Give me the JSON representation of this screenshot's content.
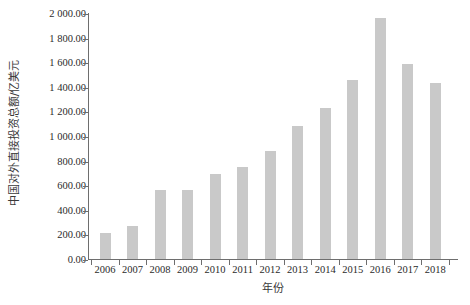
{
  "chart_data": {
    "type": "bar",
    "title": "",
    "subtitle": "",
    "xlabel": "年份",
    "ylabel": "中国对外直接投资总额/亿美元",
    "categories": [
      "2006",
      "2007",
      "2008",
      "2009",
      "2010",
      "2011",
      "2012",
      "2013",
      "2014",
      "2015",
      "2016",
      "2017",
      "2018"
    ],
    "values": [
      211,
      265,
      559,
      565,
      688,
      747,
      878,
      1078,
      1231,
      1456,
      1961,
      1583,
      1430
    ],
    "series": [
      {
        "name": "中国对外直接投资总额",
        "values": [
          211,
          265,
          559,
          565,
          688,
          747,
          878,
          1078,
          1231,
          1456,
          1961,
          1583,
          1430
        ]
      }
    ],
    "ylim": [
      0,
      2000
    ],
    "y_ticks": [
      0,
      200,
      400,
      600,
      800,
      1000,
      1200,
      1400,
      1600,
      1800,
      2000
    ],
    "y_tick_labels": [
      "0.00",
      "200.00",
      "400.00",
      "600.00",
      "800.00",
      "1 000.00",
      "1 200.00",
      "1 400.00",
      "1 600.00",
      "1 800.00",
      "2 000.00"
    ],
    "x_tick_labels": [
      "2006",
      "2007",
      "2008",
      "2009",
      "2010",
      "2011",
      "2012",
      "2013",
      "2014",
      "2015",
      "2016",
      "2017",
      "2018"
    ],
    "grid": false,
    "legend": false,
    "legend_position": "none",
    "bar_color": "#c9c9c9",
    "axis_color": "#6e6e6e",
    "background_color": "#ffffff",
    "annotations": []
  }
}
